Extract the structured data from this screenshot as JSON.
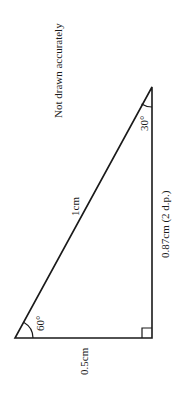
{
  "diagram": {
    "note": "Not drawn accurately",
    "hypotenuse_label": "1cm",
    "vertical_side_label": "0.87cm (2 d.p.)",
    "base_label": "0.5cm",
    "top_angle_label": "30°",
    "left_angle_label": "60°",
    "right_angle_marker": "right-angle",
    "colors": {
      "line": "#1a1a1a",
      "background": "#ffffff"
    }
  }
}
